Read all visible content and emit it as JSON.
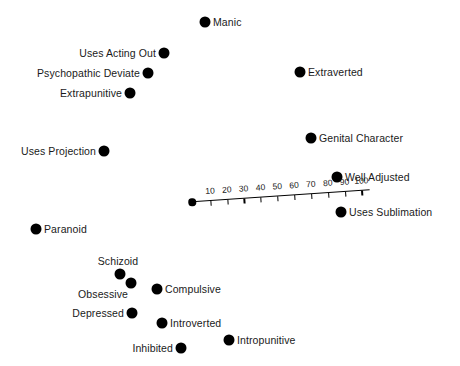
{
  "chart_data": {
    "type": "scatter",
    "title": "",
    "xlabel": "",
    "ylabel": "",
    "grid": false,
    "legend": "none",
    "axis": {
      "name": "diagonal-scale-ruler",
      "tick_values": [
        10,
        20,
        30,
        40,
        50,
        60,
        70,
        80,
        90,
        100
      ],
      "tick_labels": [
        "10",
        "20",
        "30",
        "40",
        "50",
        "60",
        "70",
        "80",
        "90",
        "100"
      ],
      "origin_marker": true,
      "range": [
        0,
        105
      ]
    },
    "points": [
      {
        "label": "Manic",
        "x": 205,
        "y": 22,
        "label_side": "right",
        "r": 5.5
      },
      {
        "label": "Uses Acting Out",
        "x": 164,
        "y": 53,
        "label_side": "left",
        "r": 5.5
      },
      {
        "label": "Psychopathic Deviate",
        "x": 148,
        "y": 73,
        "label_side": "left",
        "r": 5.5
      },
      {
        "label": "Extrapunitive",
        "x": 130,
        "y": 93,
        "label_side": "left",
        "r": 5.5
      },
      {
        "label": "Extraverted",
        "x": 300,
        "y": 72,
        "label_side": "right",
        "r": 5.5
      },
      {
        "label": "Uses Projection",
        "x": 104,
        "y": 151,
        "label_side": "left",
        "r": 5.5
      },
      {
        "label": "Genital Character",
        "x": 311,
        "y": 138,
        "label_side": "right",
        "r": 5.5
      },
      {
        "label": "Well Adjusted",
        "x": 337,
        "y": 177,
        "label_side": "right",
        "r": 5.5
      },
      {
        "label": "Uses Sublimation",
        "x": 341,
        "y": 212,
        "label_side": "right",
        "r": 5.5
      },
      {
        "label": "Paranoid",
        "x": 36,
        "y": 229,
        "label_side": "right",
        "r": 5.5
      },
      {
        "label": "Schizoid",
        "x": 120,
        "y": 274,
        "label_side": "top",
        "r": 5.5
      },
      {
        "label": "Obsessive",
        "x": 131,
        "y": 283,
        "label_side": "bottomleft",
        "r": 5.5
      },
      {
        "label": "Compulsive",
        "x": 157,
        "y": 289,
        "label_side": "right",
        "r": 5.5
      },
      {
        "label": "Depressed",
        "x": 132,
        "y": 313,
        "label_side": "left",
        "r": 5.5
      },
      {
        "label": "Introverted",
        "x": 162,
        "y": 323,
        "label_side": "right",
        "r": 5.5
      },
      {
        "label": "Intropunitive",
        "x": 229,
        "y": 340,
        "label_side": "right",
        "r": 5.5
      },
      {
        "label": "Inhibited",
        "x": 181,
        "y": 348,
        "label_side": "left",
        "r": 5.5
      }
    ]
  },
  "colors": {
    "marker": "#000000",
    "text": "#1a1a1a",
    "background": "#ffffff",
    "axis": "#000000"
  }
}
